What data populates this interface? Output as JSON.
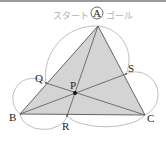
{
  "diagram": {
    "type": "geometry-triangle-route",
    "start_label": "スタート",
    "goal_label": "ゴール",
    "points": {
      "A": {
        "label": "A",
        "x": 98,
        "y": 26
      },
      "B": {
        "label": "B",
        "x": 20,
        "y": 114
      },
      "C": {
        "label": "C",
        "x": 145,
        "y": 115
      },
      "P": {
        "label": "P",
        "x": 75,
        "y": 93
      },
      "Q": {
        "label": "Q",
        "x": 46,
        "y": 83
      },
      "R": {
        "label": "R",
        "x": 67,
        "y": 116
      },
      "S": {
        "label": "S",
        "x": 126,
        "y": 74
      }
    },
    "segments": [
      "AB",
      "BC",
      "CA",
      "AR",
      "BS",
      "CQ"
    ],
    "arcs": [
      "A-Q",
      "Q-B",
      "B-R",
      "R-C",
      "C-S",
      "S-A"
    ],
    "colors": {
      "triangle_fill": "#d4d4d4",
      "lines": "#555555",
      "arcs": "#b8b8b8",
      "labels": "#222222",
      "route_text": "#b0b0b0",
      "top_rule": "#9a9a9a"
    }
  }
}
